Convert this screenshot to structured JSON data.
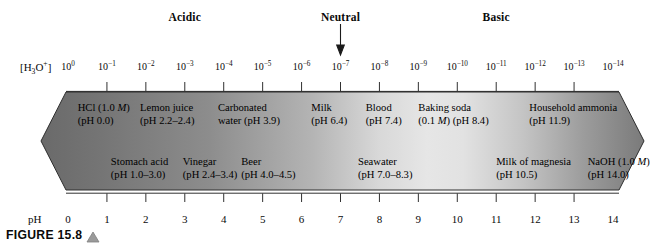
{
  "figure": {
    "caption_label": "FIGURE 15.8",
    "caption_marker_icon": "triangle-up-icon"
  },
  "zones": [
    {
      "name": "acidic",
      "label": "Acidic",
      "ph_center": 3
    },
    {
      "name": "neutral",
      "label": "Neutral",
      "ph_center": 7
    },
    {
      "name": "basic",
      "label": "Basic",
      "ph_center": 11
    }
  ],
  "neutral_marker": {
    "icon": "arrow-down-icon",
    "points_to_ph": 7,
    "points_to_concentration": "10^-7"
  },
  "concentration_axis": {
    "title": "[H3O+]",
    "title_html": "[H<sub>3</sub>O<sup>+</sup>]",
    "ticks": [
      {
        "mantissa": "10",
        "exponent": "0"
      },
      {
        "mantissa": "10",
        "exponent": "−1"
      },
      {
        "mantissa": "10",
        "exponent": "−2"
      },
      {
        "mantissa": "10",
        "exponent": "−3"
      },
      {
        "mantissa": "10",
        "exponent": "−4"
      },
      {
        "mantissa": "10",
        "exponent": "−5"
      },
      {
        "mantissa": "10",
        "exponent": "−6"
      },
      {
        "mantissa": "10",
        "exponent": "−7"
      },
      {
        "mantissa": "10",
        "exponent": "−8"
      },
      {
        "mantissa": "10",
        "exponent": "−9"
      },
      {
        "mantissa": "10",
        "exponent": "−10"
      },
      {
        "mantissa": "10",
        "exponent": "−11"
      },
      {
        "mantissa": "10",
        "exponent": "−12"
      },
      {
        "mantissa": "10",
        "exponent": "−13"
      },
      {
        "mantissa": "10",
        "exponent": "−14"
      }
    ]
  },
  "ph_axis": {
    "title": "pH",
    "ticks": [
      "0",
      "1",
      "2",
      "3",
      "4",
      "5",
      "6",
      "7",
      "8",
      "9",
      "10",
      "11",
      "12",
      "13",
      "14"
    ],
    "min": 0,
    "max": 14
  },
  "banner": {
    "shape": "double-headed-arrow",
    "gradient_dark_hex": "#6e6e6e",
    "gradient_light_hex": "#e9e9e9",
    "outline_hex": "#3a3a3a"
  },
  "substances": {
    "upper_row": [
      {
        "name": "HCl",
        "line1": "HCl (1.0 M)",
        "line2": "(pH 0.0)",
        "ph": 0.0,
        "anchor_ph": 0.25
      },
      {
        "name": "lemon-juice",
        "line1": "Lemon juice",
        "line2": "(pH 2.2–2.4)",
        "ph": 2.3,
        "anchor_ph": 1.85
      },
      {
        "name": "carbonated-water",
        "line1": "Carbonated",
        "line2": "water (pH 3.9)",
        "ph": 3.9,
        "anchor_ph": 3.85
      },
      {
        "name": "milk",
        "line1": "Milk",
        "line2": "(pH 6.4)",
        "ph": 6.4,
        "anchor_ph": 6.25
      },
      {
        "name": "blood",
        "line1": "Blood",
        "line2": "(pH 7.4)",
        "ph": 7.4,
        "anchor_ph": 7.65
      },
      {
        "name": "baking-soda",
        "line1": "Baking soda",
        "line2": "(0.1 M) (pH 8.4)",
        "ph": 8.4,
        "anchor_ph": 9.0
      },
      {
        "name": "household-ammonia",
        "line1": "Household ammonia",
        "line2": "(pH 11.9)",
        "ph": 11.9,
        "anchor_ph": 11.85
      }
    ],
    "lower_row": [
      {
        "name": "stomach-acid",
        "line1": "Stomach acid",
        "line2": "(pH 1.0–3.0)",
        "ph": 2.0,
        "anchor_ph": 1.1
      },
      {
        "name": "vinegar",
        "line1": "Vinegar",
        "line2": "(pH 2.4–3.4)",
        "ph": 2.9,
        "anchor_ph": 2.95
      },
      {
        "name": "beer",
        "line1": "Beer",
        "line2": "(pH 4.0–4.5)",
        "ph": 4.25,
        "anchor_ph": 4.45
      },
      {
        "name": "seawater",
        "line1": "Seawater",
        "line2": "(pH 7.0–8.3)",
        "ph": 7.65,
        "anchor_ph": 7.45
      },
      {
        "name": "milk-of-magnesia",
        "line1": "Milk of magnesia",
        "line2": "(pH 10.5)",
        "ph": 10.5,
        "anchor_ph": 11.0
      },
      {
        "name": "naoh",
        "line1": "NaOH (1.0 M)",
        "line2": "(pH 14.0)",
        "ph": 14.0,
        "anchor_ph": 13.35
      }
    ]
  },
  "chart_data": {
    "type": "scale-diagram",
    "xlabel": "pH",
    "secondary_xlabel": "[H3O+]",
    "xlim": [
      0,
      14
    ],
    "xticks": [
      0,
      1,
      2,
      3,
      4,
      5,
      6,
      7,
      8,
      9,
      10,
      11,
      12,
      13,
      14
    ],
    "secondary_xticks": [
      "10^0",
      "10^-1",
      "10^-2",
      "10^-3",
      "10^-4",
      "10^-5",
      "10^-6",
      "10^-7",
      "10^-8",
      "10^-9",
      "10^-10",
      "10^-11",
      "10^-12",
      "10^-13",
      "10^-14"
    ],
    "regions": [
      {
        "label": "Acidic",
        "range": [
          0,
          7
        ]
      },
      {
        "label": "Neutral",
        "range": [
          7,
          7
        ]
      },
      {
        "label": "Basic",
        "range": [
          7,
          14
        ]
      }
    ],
    "points": [
      {
        "label": "HCl (1.0 M)",
        "ph": 0.0
      },
      {
        "label": "Stomach acid",
        "ph_range": [
          1.0,
          3.0
        ]
      },
      {
        "label": "Lemon juice",
        "ph_range": [
          2.2,
          2.4
        ]
      },
      {
        "label": "Vinegar",
        "ph_range": [
          2.4,
          3.4
        ]
      },
      {
        "label": "Carbonated water",
        "ph": 3.9
      },
      {
        "label": "Beer",
        "ph_range": [
          4.0,
          4.5
        ]
      },
      {
        "label": "Milk",
        "ph": 6.4
      },
      {
        "label": "Seawater",
        "ph_range": [
          7.0,
          8.3
        ]
      },
      {
        "label": "Blood",
        "ph": 7.4
      },
      {
        "label": "Baking soda (0.1 M)",
        "ph": 8.4
      },
      {
        "label": "Milk of magnesia",
        "ph": 10.5
      },
      {
        "label": "Household ammonia",
        "ph": 11.9
      },
      {
        "label": "NaOH (1.0 M)",
        "ph": 14.0
      }
    ],
    "grid": false,
    "legend": "none"
  }
}
